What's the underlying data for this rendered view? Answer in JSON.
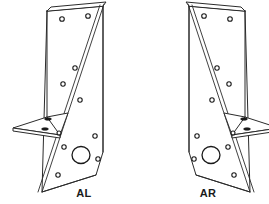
{
  "drawing": {
    "title": "Bracket Pair Technical Illustration",
    "background_color": "#ffffff",
    "line_color": "#2b2b2b",
    "hole_color": "#1a1a1a",
    "canvas": {
      "width": 269,
      "height": 204
    }
  },
  "parts": [
    {
      "id": "al",
      "label": "AL",
      "description": "Left-hand angle bracket, isometric view",
      "label_position": {
        "x": 84,
        "y": 197
      },
      "orientation": "left",
      "shelf_side": "left",
      "hole_count": 12,
      "large_hole_count": 1,
      "slot_count": 2
    },
    {
      "id": "ar",
      "label": "AR",
      "description": "Right-hand angle bracket, isometric view, mirror of AL",
      "label_position": {
        "x": 208,
        "y": 197
      },
      "orientation": "right",
      "shelf_side": "right",
      "hole_count": 12,
      "large_hole_count": 1,
      "slot_count": 2
    }
  ]
}
